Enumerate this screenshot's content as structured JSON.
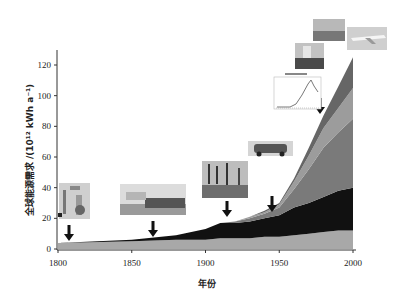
{
  "chart_data": {
    "type": "area",
    "stacked": true,
    "title": "",
    "xlabel": "年份",
    "ylabel": "全球能源需求 /(10¹² kWh a⁻¹)",
    "xlim": [
      1800,
      2000
    ],
    "ylim": [
      0,
      130
    ],
    "x_ticks": [
      "1800",
      "1850",
      "1900",
      "1950",
      "2000"
    ],
    "y_ticks": [
      "0",
      "20",
      "40",
      "60",
      "80",
      "100",
      "120"
    ],
    "grid": false,
    "legend": null,
    "x": [
      1800,
      1850,
      1880,
      1900,
      1910,
      1920,
      1930,
      1940,
      1950,
      1960,
      1970,
      1980,
      1990,
      2000
    ],
    "series": [
      {
        "name": "layer-1 (light gray, bottom)",
        "color": "#a8a8a8",
        "values": [
          4,
          5,
          6,
          6,
          7,
          7,
          7,
          8,
          8,
          9,
          10,
          11,
          12,
          12
        ]
      },
      {
        "name": "layer-2 (black)",
        "color": "#111111",
        "values": [
          0,
          1,
          3,
          7,
          10,
          10,
          11,
          12,
          14,
          18,
          20,
          23,
          26,
          28
        ]
      },
      {
        "name": "layer-3 (medium gray)",
        "color": "#7a7a7a",
        "values": [
          0,
          0,
          0,
          0,
          0,
          1,
          2,
          3,
          5,
          12,
          22,
          32,
          38,
          45
        ]
      },
      {
        "name": "layer-4 (light gray)",
        "color": "#9c9c9c",
        "values": [
          0,
          0,
          0,
          0,
          0,
          0,
          1,
          1,
          2,
          5,
          9,
          13,
          16,
          20
        ]
      },
      {
        "name": "layer-5 (dark gray, top)",
        "color": "#666666",
        "values": [
          0,
          0,
          0,
          0,
          0,
          0,
          0,
          1,
          1,
          2,
          5,
          8,
          14,
          20
        ]
      }
    ],
    "annotations": [
      {
        "type": "arrow",
        "x": 1808,
        "label": "steam engine image"
      },
      {
        "type": "arrow",
        "x": 1865,
        "label": "ship image"
      },
      {
        "type": "arrow",
        "x": 1915,
        "label": "oil derricks image"
      },
      {
        "type": "arrow",
        "x": 1947,
        "label": "car image"
      },
      {
        "type": "arrow",
        "x": 1980,
        "label": "oil peak inset chart"
      },
      {
        "type": "image",
        "label": "oil platform image"
      },
      {
        "type": "image",
        "label": "landscape image"
      },
      {
        "type": "image",
        "label": "airplane image"
      }
    ]
  }
}
